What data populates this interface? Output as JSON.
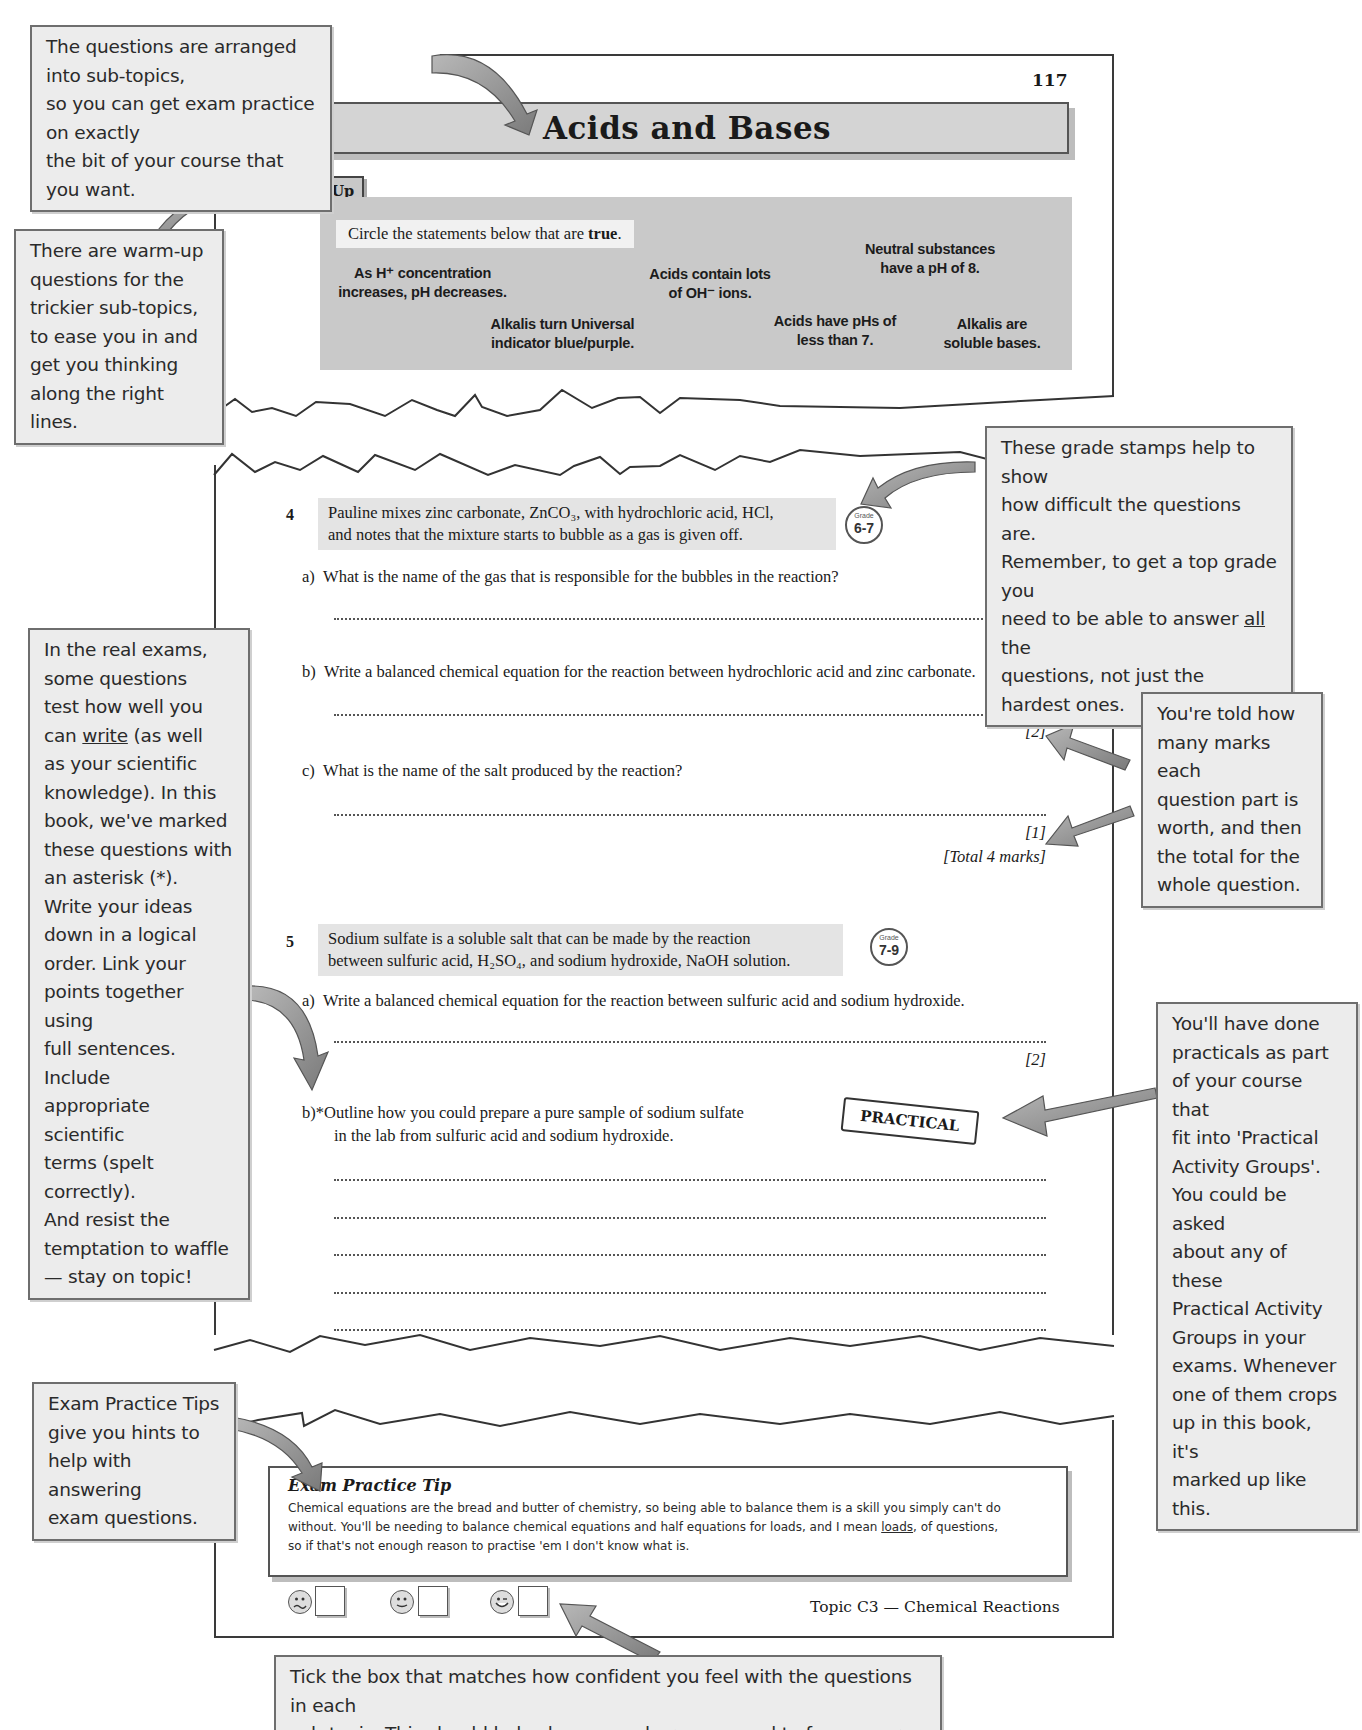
{
  "page": {
    "number": "117",
    "title": "Acids and Bases",
    "footer_topic": "Topic C3 — Chemical Reactions"
  },
  "warmup": {
    "tag": "Warm-Up",
    "instruction_prefix": "Circle the statements below that are ",
    "instruction_bold": "true",
    "instruction_suffix": ".",
    "statements": [
      {
        "line1": "As H⁺ concentration",
        "line2": "increases, pH decreases."
      },
      {
        "line1": "Acids contain lots",
        "line2": "of OH⁻ ions."
      },
      {
        "line1": "Neutral substances",
        "line2": "have a pH of 8."
      },
      {
        "line1": "Alkalis turn Universal",
        "line2": "indicator blue/purple."
      },
      {
        "line1": "Acids have pHs of",
        "line2": "less than 7."
      },
      {
        "line1": "Alkalis are",
        "line2": "soluble bases."
      }
    ]
  },
  "questions": [
    {
      "number": "4",
      "stem_line1": "Pauline mixes zinc carbonate, ZnCO₃, with hydrochloric acid, HCl,",
      "stem_line2": "and notes that the mixture starts to bubble as a gas is given off.",
      "grade_label": "Grade",
      "grade": "6-7",
      "parts": [
        {
          "label": "a)",
          "text": "What is the name of the gas that is responsible for the bubbles in the reaction?",
          "marks": "[1]"
        },
        {
          "label": "b)",
          "text": "Write a balanced chemical equation for the reaction between hydrochloric acid and zinc carbonate.",
          "marks": "[2]"
        },
        {
          "label": "c)",
          "text": "What is the name of the salt produced by the reaction?",
          "marks": "[1]"
        }
      ],
      "total": "[Total 4 marks]"
    },
    {
      "number": "5",
      "stem_line1": "Sodium sulfate is a soluble salt that can be made by the reaction",
      "stem_line2": "between sulfuric acid, H₂SO₄, and sodium hydroxide, NaOH solution.",
      "grade_label": "Grade",
      "grade": "7-9",
      "parts": [
        {
          "label": "a)",
          "text": "Write a balanced chemical equation for the reaction between sulfuric acid and sodium hydroxide.",
          "marks": "[2]"
        },
        {
          "label": "b)*",
          "line1": "Outline how you could prepare a pure sample of sodium sulfate",
          "line2": "in the lab from sulfuric acid and sodium hydroxide."
        }
      ],
      "stamp": "PRACTICAL"
    }
  ],
  "tip": {
    "title": "Exam Practice Tip",
    "line1": "Chemical equations are the bread and butter of chemistry, so being able to balance them is a skill you simply can't do",
    "line2_pre": "without.  You'll be needing to balance chemical equations and half equations for loads, and I mean ",
    "line2_u": "loads",
    "line2_post": ", of questions,",
    "line3": "so if that's not enough reason to practise 'em I don't know what is."
  },
  "confidence": {
    "faces": [
      "unhappy-face",
      "neutral-face",
      "happy-face"
    ]
  },
  "callouts": {
    "subtopics": [
      "The questions are arranged into sub-topics,",
      "so you can get exam practice on exactly",
      "the bit of your course that you want."
    ],
    "warmup": [
      "There are warm-up",
      "questions for the",
      "trickier sub-topics,",
      "to ease you in and",
      "get you thinking",
      "along the right lines."
    ],
    "grades": {
      "l1": "These grade stamps help to show",
      "l2": "how difficult the questions are.",
      "l3": "Remember, to get a top grade you",
      "l4_pre": "need to be able to answer ",
      "l4_u": "all",
      "l4_post": " the",
      "l5": "questions, not just the hardest ones."
    },
    "writing": {
      "l1": "In the real exams,",
      "l2": "some questions",
      "l3": "test how well you",
      "l4_pre": "can ",
      "l4_u": "write",
      "l4_post": " (as well",
      "rest": [
        "as your scientific",
        "knowledge).  In this",
        "book, we've marked",
        "these questions with",
        "an asterisk (*).",
        "Write your ideas",
        "down in a logical",
        "order.  Link your",
        "points together using",
        "full sentences.  Include",
        "appropriate scientific",
        "terms (spelt correctly).",
        "And resist the",
        "temptation to waffle",
        "— stay on topic!"
      ]
    },
    "marks": [
      "You're told how",
      "many marks each",
      "question part is",
      "worth, and then",
      "the total for the",
      "whole question."
    ],
    "practical": [
      "You'll have done",
      "practicals as part",
      "of your course that",
      "fit into 'Practical",
      "Activity Groups'.",
      "You could be asked",
      "about any of these",
      "Practical Activity",
      "Groups in your",
      "exams.  Whenever",
      "one of them crops",
      "up in this book, it's",
      "marked up like this."
    ],
    "tips": [
      "Exam Practice Tips",
      "give you hints to",
      "help with answering",
      "exam questions."
    ],
    "tick": [
      "Tick the box that matches how confident you feel with the questions in each",
      "sub-topic.  This should help show you where you need to focus your revision."
    ]
  }
}
